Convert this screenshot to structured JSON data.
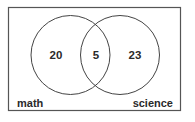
{
  "diagram": {
    "type": "venn",
    "universal_set": {
      "box": {
        "x": 8.5,
        "y": 7.5,
        "width": 172,
        "height": 103
      },
      "stroke": "#555555",
      "fill": "#ffffff"
    },
    "sets": [
      {
        "id": "math",
        "label": "math",
        "cx": 70.5,
        "cy": 55,
        "r": 39.5,
        "stroke": "#444444"
      },
      {
        "id": "science",
        "label": "science",
        "cx": 120,
        "cy": 55,
        "r": 39.5,
        "stroke": "#444444"
      }
    ],
    "regions": {
      "math_only": {
        "value": "20"
      },
      "both": {
        "value": "5"
      },
      "science_only": {
        "value": "23"
      }
    },
    "labels": {
      "left": "math",
      "right": "science"
    }
  }
}
